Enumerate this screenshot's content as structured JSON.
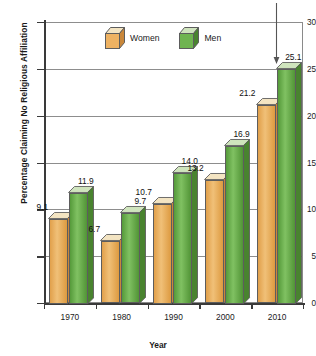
{
  "chart_data": {
    "type": "bar",
    "title": "",
    "xlabel": "Year",
    "ylabel": "Percentage Claiming No Religious Affiliation",
    "categories": [
      "1970",
      "1980",
      "1990",
      "2000",
      "2010"
    ],
    "series": [
      {
        "name": "Women",
        "color": "#e8a952",
        "values": [
          9.1,
          6.7,
          10.7,
          13.2,
          21.2
        ]
      },
      {
        "name": "Men",
        "color": "#5ba03f",
        "values": [
          11.9,
          9.7,
          14.0,
          16.9,
          25.1
        ]
      }
    ],
    "value_labels": {
      "Women": [
        "9.1",
        "6.7",
        "10.7",
        "13.2",
        "21.2"
      ],
      "Men": [
        "11.9",
        "9.7",
        "14.0",
        "16.9",
        "25.1"
      ]
    },
    "ylim": [
      0,
      30
    ],
    "ytick_values": [
      0,
      5,
      10,
      15,
      20,
      25,
      30
    ],
    "ytick_labels": [
      "0",
      "5",
      "10",
      "15",
      "20",
      "25",
      "30"
    ],
    "grid": true,
    "legend_position": "top-center-inside",
    "annotations": [
      {
        "name": "down-arrow-to-2010-men",
        "target": "Men 2010 (25.1)",
        "shape": "vertical-line-with-down-arrowhead"
      }
    ]
  },
  "legend": {
    "items": [
      {
        "label": "Women",
        "swatch": "orange-cube-icon"
      },
      {
        "label": "Men",
        "swatch": "green-cube-icon"
      }
    ]
  },
  "axes": {
    "y_title": "Percentage Claiming No Religious Affiliation",
    "x_title": "Year"
  }
}
